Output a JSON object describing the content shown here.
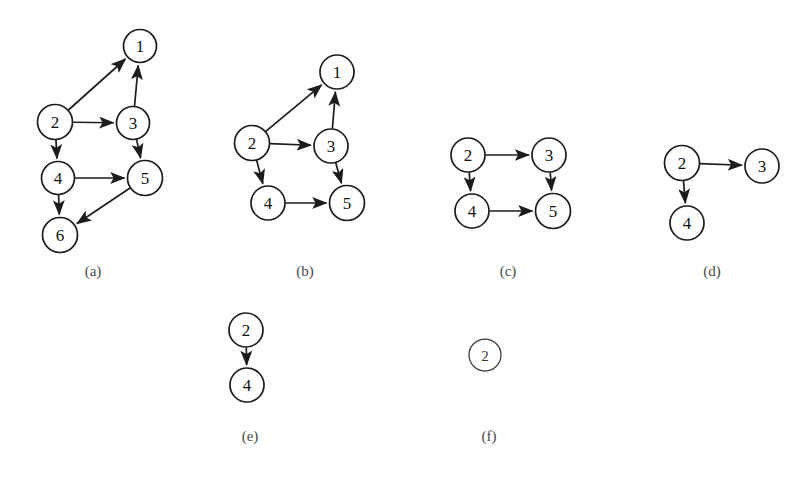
{
  "figure": {
    "width": 812,
    "height": 481,
    "background": "#ffffff",
    "stroke_color": "#1c1c1c",
    "text_color": "#111111",
    "label_color": "#4a4a4a",
    "caption": "",
    "panel_count": 6
  },
  "panels": [
    {
      "id": "a",
      "label": "(a)",
      "label_x": 93,
      "label_y": 271,
      "node_radius": 16.5,
      "nodes": [
        {
          "id": "1",
          "label": "1",
          "x": 140,
          "y": 46,
          "r": 16.5
        },
        {
          "id": "2",
          "label": "2",
          "x": 55,
          "y": 122,
          "r": 17.5
        },
        {
          "id": "3",
          "label": "3",
          "x": 133,
          "y": 123,
          "r": 16.5
        },
        {
          "id": "4",
          "label": "4",
          "x": 58,
          "y": 178,
          "r": 16.5
        },
        {
          "id": "5",
          "label": "5",
          "x": 145,
          "y": 178,
          "r": 17.5
        },
        {
          "id": "6",
          "label": "6",
          "x": 60,
          "y": 235,
          "r": 17.5
        }
      ],
      "edges": [
        {
          "from": "2",
          "to": "1"
        },
        {
          "from": "2",
          "to": "3"
        },
        {
          "from": "2",
          "to": "4"
        },
        {
          "from": "3",
          "to": "1"
        },
        {
          "from": "3",
          "to": "5"
        },
        {
          "from": "4",
          "to": "5"
        },
        {
          "from": "4",
          "to": "6"
        },
        {
          "from": "5",
          "to": "6"
        }
      ]
    },
    {
      "id": "b",
      "label": "(b)",
      "label_x": 305,
      "label_y": 271,
      "node_radius": 16.5,
      "nodes": [
        {
          "id": "1",
          "label": "1",
          "x": 337,
          "y": 72,
          "r": 17.0
        },
        {
          "id": "2",
          "label": "2",
          "x": 252,
          "y": 143,
          "r": 17.5
        },
        {
          "id": "3",
          "label": "3",
          "x": 331,
          "y": 146,
          "r": 17.0
        },
        {
          "id": "4",
          "label": "4",
          "x": 268,
          "y": 203,
          "r": 17.0
        },
        {
          "id": "5",
          "label": "5",
          "x": 347,
          "y": 203,
          "r": 17.5
        }
      ],
      "edges": [
        {
          "from": "2",
          "to": "1"
        },
        {
          "from": "2",
          "to": "3"
        },
        {
          "from": "2",
          "to": "4"
        },
        {
          "from": "3",
          "to": "1"
        },
        {
          "from": "3",
          "to": "5"
        },
        {
          "from": "4",
          "to": "5"
        }
      ]
    },
    {
      "id": "c",
      "label": "(c)",
      "label_x": 508,
      "label_y": 271,
      "node_radius": 16.5,
      "nodes": [
        {
          "id": "2",
          "label": "2",
          "x": 468,
          "y": 155,
          "r": 17.0
        },
        {
          "id": "3",
          "label": "3",
          "x": 549,
          "y": 155,
          "r": 17.0
        },
        {
          "id": "4",
          "label": "4",
          "x": 472,
          "y": 211,
          "r": 17.0
        },
        {
          "id": "5",
          "label": "5",
          "x": 553,
          "y": 211,
          "r": 17.5
        }
      ],
      "edges": [
        {
          "from": "2",
          "to": "3"
        },
        {
          "from": "2",
          "to": "4"
        },
        {
          "from": "3",
          "to": "5"
        },
        {
          "from": "4",
          "to": "5"
        }
      ]
    },
    {
      "id": "d",
      "label": "(d)",
      "label_x": 712,
      "label_y": 271,
      "node_radius": 16.5,
      "nodes": [
        {
          "id": "2",
          "label": "2",
          "x": 682,
          "y": 163,
          "r": 17.5
        },
        {
          "id": "3",
          "label": "3",
          "x": 762,
          "y": 166,
          "r": 17.0
        },
        {
          "id": "4",
          "label": "4",
          "x": 687,
          "y": 223,
          "r": 17.0
        }
      ],
      "edges": [
        {
          "from": "2",
          "to": "3"
        },
        {
          "from": "2",
          "to": "4"
        }
      ]
    },
    {
      "id": "e",
      "label": "(e)",
      "label_x": 250,
      "label_y": 436,
      "node_radius": 16.5,
      "nodes": [
        {
          "id": "2",
          "label": "2",
          "x": 246,
          "y": 330,
          "r": 17.0
        },
        {
          "id": "4",
          "label": "4",
          "x": 247,
          "y": 385,
          "r": 17.0
        }
      ],
      "edges": [
        {
          "from": "2",
          "to": "4"
        }
      ]
    },
    {
      "id": "f",
      "label": "(f)",
      "label_x": 489,
      "label_y": 436,
      "node_radius": 16.0,
      "nodes": [
        {
          "id": "2",
          "label": "2",
          "x": 485,
          "y": 355,
          "r": 16.0,
          "thin": true
        }
      ],
      "edges": []
    }
  ],
  "chart_data": {
    "type": "diagram",
    "title": "",
    "graphs": [
      {
        "panel": "(a)",
        "nodes": [
          "1",
          "2",
          "3",
          "4",
          "5",
          "6"
        ],
        "edges": [
          [
            "2",
            "1"
          ],
          [
            "2",
            "3"
          ],
          [
            "2",
            "4"
          ],
          [
            "3",
            "1"
          ],
          [
            "3",
            "5"
          ],
          [
            "4",
            "5"
          ],
          [
            "4",
            "6"
          ],
          [
            "5",
            "6"
          ]
        ]
      },
      {
        "panel": "(b)",
        "nodes": [
          "1",
          "2",
          "3",
          "4",
          "5"
        ],
        "edges": [
          [
            "2",
            "1"
          ],
          [
            "2",
            "3"
          ],
          [
            "2",
            "4"
          ],
          [
            "3",
            "1"
          ],
          [
            "3",
            "5"
          ],
          [
            "4",
            "5"
          ]
        ]
      },
      {
        "panel": "(c)",
        "nodes": [
          "2",
          "3",
          "4",
          "5"
        ],
        "edges": [
          [
            "2",
            "3"
          ],
          [
            "2",
            "4"
          ],
          [
            "3",
            "5"
          ],
          [
            "4",
            "5"
          ]
        ]
      },
      {
        "panel": "(d)",
        "nodes": [
          "2",
          "3",
          "4"
        ],
        "edges": [
          [
            "2",
            "3"
          ],
          [
            "2",
            "4"
          ]
        ]
      },
      {
        "panel": "(e)",
        "nodes": [
          "2",
          "4"
        ],
        "edges": [
          [
            "2",
            "4"
          ]
        ]
      },
      {
        "panel": "(f)",
        "nodes": [
          "2"
        ],
        "edges": []
      }
    ]
  }
}
